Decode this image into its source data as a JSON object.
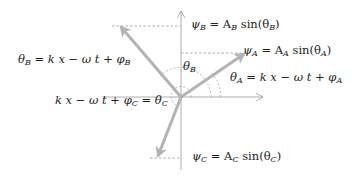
{
  "diagram": {
    "type": "phasor-diagram",
    "colors": {
      "vector": "#b3b3b3",
      "axis": "#999999",
      "dashed": "#999999",
      "text": "#222222"
    },
    "labels": {
      "psi_b": {
        "lhs": "ψ",
        "lhs_sub": "B",
        "eq": " = A",
        "amp_sub": "B",
        "fn": " sin(θ",
        "arg_sub": "B",
        "close": ")"
      },
      "psi_a": {
        "lhs": "ψ",
        "lhs_sub": "A",
        "eq": " = A",
        "amp_sub": "A",
        "fn": " sin(θ",
        "arg_sub": "A",
        "close": ")"
      },
      "psi_c": {
        "lhs": "ψ",
        "lhs_sub": "C",
        "eq": " = A",
        "amp_sub": "C",
        "fn": " sin(θ",
        "arg_sub": "C",
        "close": ")"
      },
      "theta_b_eq": {
        "lhs": "θ",
        "lhs_sub": "B",
        "rhs": " = k x − ω t + φ",
        "rhs_sub": "B"
      },
      "theta_a_eq": {
        "lhs": "θ",
        "lhs_sub": "A",
        "rhs": " = k x − ω t + φ",
        "rhs_sub": "A"
      },
      "theta_c_eq": {
        "lhs": "k x − ω t + φ",
        "lhs_sub": "C",
        "rhs": " = θ",
        "rhs_sub": "C"
      },
      "theta_b_angle": {
        "sym": "θ",
        "sub": "B"
      }
    },
    "vectors": [
      {
        "name": "A",
        "to": [
          245,
          53
        ]
      },
      {
        "name": "B",
        "to": [
          120,
          26
        ]
      },
      {
        "name": "C",
        "to": [
          157,
          157
        ]
      }
    ],
    "origin": [
      181,
      97
    ]
  }
}
